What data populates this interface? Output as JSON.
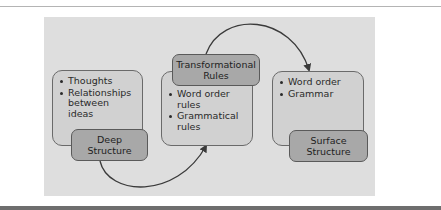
{
  "diagram": {
    "boxes": [
      {
        "id": "deep",
        "items": [
          "Thoughts",
          "Relationships between ideas"
        ],
        "label_line1": "Deep",
        "label_line2": "Structure"
      },
      {
        "id": "transformational",
        "items": [
          "Word order rules",
          "Grammatical rules"
        ],
        "label_line1": "Transformational",
        "label_line2": "Rules"
      },
      {
        "id": "surface",
        "items": [
          "Word order",
          "Grammar"
        ],
        "label_line1": "Surface",
        "label_line2": "Structure"
      }
    ],
    "arrows": [
      {
        "from": "Deep Structure",
        "to": "Transformational Rules box",
        "direction": "below, curving up"
      },
      {
        "from": "Transformational Rules",
        "to": "Surface Structure box",
        "direction": "above, curving down"
      }
    ],
    "colors": {
      "panel": "#dedede",
      "box_fill": "#d1d1d1",
      "label_fill": "#a8a8a8",
      "arrow": "#3a3a3a"
    }
  }
}
